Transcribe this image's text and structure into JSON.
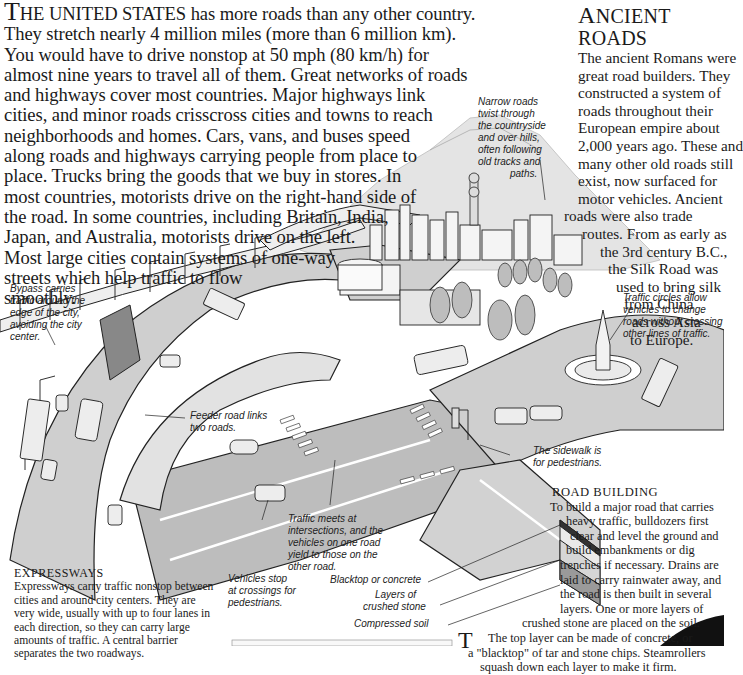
{
  "intro": {
    "dropcap": "T",
    "smallcaps": "HE UNITED STATES",
    "lines": [
      " has more roads than any other country.",
      "They stretch nearly 4 million miles (more than 6 million km).",
      "You would have to drive nonstop at 50 mph (80 km/h) for",
      "almost nine years to travel all of them. Great networks of roads",
      "and highways cover most countries. Major highways link",
      "cities, and minor roads crisscross cities and towns to reach",
      "neighborhoods and homes. Cars, vans, and buses speed",
      "along roads and highways carrying people from place to",
      "place. Trucks bring the goods that we buy in stores.  In",
      "most countries, motorists drive on the right-hand side of",
      "the road. In some countries, including Britain, India,",
      "Japan, and Australia, motorists drive on the left.",
      "Most large cities contain systems of one-way",
      "streets which help traffic to flow",
      "smoothly."
    ]
  },
  "ancient_roads": {
    "title_cap": "A",
    "title_rest": "NCIENT ROADS",
    "lines": [
      "The ancient Romans were",
      "great road builders. They",
      "constructed a system of",
      "roads throughout their",
      "European empire about",
      "2,000 years ago. These and",
      "many other old roads still",
      "exist, now surfaced for",
      "motor vehicles. Ancient",
      "roads were also trade",
      "routes. From as early as",
      "the 3rd century B.C.,",
      "the Silk Road was",
      "used to bring silk",
      "from China",
      "across Asia",
      "to Europe."
    ]
  },
  "captions": {
    "narrow_roads": [
      "Narrow roads",
      "twist through",
      "the countryside",
      "and over hills,",
      "often following",
      "old tracks and",
      "paths."
    ],
    "bypass": [
      "Bypass carries",
      "traffic around the",
      "edge of the city,",
      "avoiding the city",
      "center."
    ],
    "traffic_circles": [
      "Traffic circles allow",
      "vehicles to change",
      "roads without crossing",
      "other lines of traffic."
    ],
    "feeder_road": [
      "Feeder road links",
      "two roads."
    ],
    "sidewalk": [
      "The sidewalk is",
      "for pedestrians."
    ],
    "traffic_meets": [
      "Traffic meets at",
      "intersections, and the",
      "vehicles on one road",
      "yield to those on the",
      "other road."
    ],
    "vehicles_stop": [
      "Vehicles stop",
      "at crossings for",
      "pedestrians."
    ],
    "blacktop": "Blacktop or concrete",
    "crushed_stone": [
      "Layers of",
      "crushed stone"
    ],
    "compressed_soil": "Compressed soil"
  },
  "road_building": {
    "title": "ROAD BUILDING",
    "lines": [
      "To build a major road that carries",
      "heavy traffic, bulldozers first",
      "clear and level the ground and",
      "build embankments or dig",
      "trenches if necessary. Drains are",
      "laid to carry rainwater away, and",
      "the road is then built in several",
      "layers. One or more layers of",
      "crushed stone are placed on the soil.",
      "The top layer can be made of concrete, or",
      "a \"blacktop\" of tar and stone chips. Steamrollers",
      "squash down each layer to make it firm."
    ]
  },
  "expressways": {
    "title": "EXPRESSWAYS",
    "lines": [
      "Expressways carry traffic nonstop between",
      "cities and around city centers. They are",
      "very wide, usually with up to four lanes in",
      "each direction, so they can carry large",
      "amounts of traffic. A central barrier",
      "separates the two roadways."
    ]
  },
  "next_section": {
    "dropcap": "T"
  },
  "colors": {
    "text": "#1a1a1a",
    "road": "#c8c8c8",
    "road_dark": "#9a9a9a",
    "line": "#222222",
    "sky": "#e6e6e6"
  }
}
